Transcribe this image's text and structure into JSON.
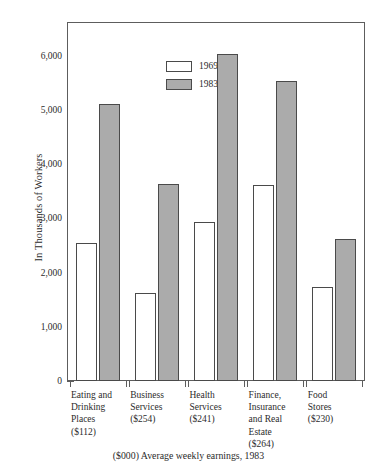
{
  "chart_data": {
    "type": "bar",
    "title": "",
    "subtitle": "",
    "xlabel": "",
    "ylabel": "In Thousands of Workers",
    "caption": "($000) Average weekly earnings, 1983",
    "ylim": [
      0,
      6600
    ],
    "yticks": [
      0,
      1000,
      2000,
      3000,
      4000,
      5000,
      6000
    ],
    "ytick_labels": [
      "0",
      "1,000",
      "2,000",
      "3,000",
      "4,000",
      "5,000",
      "6,000"
    ],
    "grid": false,
    "legend_position": "top-left",
    "categories": [
      "Eating and Drinking Places ($112)",
      "Business Services ($254)",
      "Health Services ($241)",
      "Finance, Insurance and Real Estate ($264)",
      "Food Stores ($230)"
    ],
    "category_lines": [
      [
        "Eating and",
        "Drinking",
        "Places",
        "($112)"
      ],
      [
        "Business",
        "Services",
        "($254)"
      ],
      [
        "Health",
        "Services",
        "($241)"
      ],
      [
        "Finance,",
        "Insurance",
        "and Real",
        "Estate",
        "($264)"
      ],
      [
        "Food",
        "Stores",
        "($230)"
      ]
    ],
    "average_weekly_earnings": [
      "$112",
      "$254",
      "$241",
      "$264",
      "$230"
    ],
    "series": [
      {
        "name": "1969",
        "color": "#ffffff",
        "values": [
          2550,
          1630,
          2940,
          3610,
          1740
        ]
      },
      {
        "name": "1983",
        "color": "#ababab",
        "values": [
          5110,
          3630,
          6030,
          5540,
          2620
        ]
      }
    ]
  },
  "legend": {
    "items": [
      {
        "label": "1969",
        "swatch": "white-swatch"
      },
      {
        "label": "1983",
        "swatch": "gray-swatch"
      }
    ]
  },
  "colors": {
    "bar_1969_fill": "#ffffff",
    "bar_1983_fill": "#ababab",
    "bar_outline": "#4a4a4a",
    "axis": "#5d5d5d",
    "text": "#2b2b2b",
    "background": "#ffffff"
  }
}
